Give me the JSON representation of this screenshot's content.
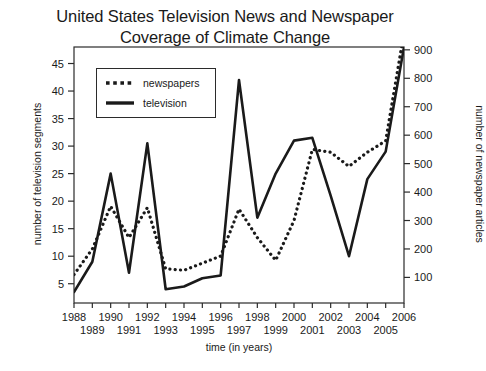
{
  "chart_data": {
    "type": "line",
    "title": "United States Television News and Newspaper Coverage of Climate Change",
    "title_line1": "United States Television News and Newspaper",
    "title_line2": "Coverage of Climate Change",
    "xlabel": "time (in years)",
    "ylabel": "number of television segments",
    "ylabel_right": "number of newspaper articles",
    "x": [
      1988,
      1989,
      1990,
      1991,
      1992,
      1993,
      1994,
      1995,
      1996,
      1997,
      1998,
      1999,
      2000,
      2001,
      2002,
      2003,
      2004,
      2005,
      2006
    ],
    "categories": [
      "1988",
      "1989",
      "1990",
      "1991",
      "1992",
      "1993",
      "1994",
      "1995",
      "1996",
      "1997",
      "1998",
      "1999",
      "2000",
      "2001",
      "2002",
      "2003",
      "2004",
      "2005",
      "2006"
    ],
    "xlim": [
      1988,
      2006
    ],
    "ylim": [
      1.5,
      48
    ],
    "ylim_right": [
      10,
      910
    ],
    "yticks": [
      5,
      10,
      15,
      20,
      25,
      30,
      35,
      40,
      45
    ],
    "ytick_labels": [
      "5",
      "10",
      "15",
      "20",
      "25",
      "30",
      "35",
      "40",
      "45"
    ],
    "yticks_right": [
      100,
      200,
      300,
      400,
      500,
      600,
      700,
      800,
      900
    ],
    "ytick_labels_right": [
      "100",
      "200",
      "300",
      "400",
      "500",
      "600",
      "700",
      "800",
      "900"
    ],
    "xticks_top_row": [
      "1988",
      "1990",
      "1992",
      "1994",
      "1996",
      "1998",
      "2000",
      "2002",
      "2004",
      "2006"
    ],
    "xticks_bottom_row": [
      "1989",
      "1991",
      "1993",
      "1995",
      "1997",
      "1999",
      "2001",
      "2003",
      "2005"
    ],
    "grid": false,
    "legend_position": "upper left",
    "series": [
      {
        "name": "newspapers",
        "axis": "right",
        "style": "dotted",
        "color": "#1a1a1a",
        "values": [
          110,
          200,
          350,
          240,
          345,
          130,
          125,
          150,
          175,
          340,
          240,
          160,
          300,
          550,
          540,
          490,
          540,
          580,
          960
        ]
      },
      {
        "name": "television",
        "axis": "left",
        "style": "solid",
        "color": "#1a1a1a",
        "values": [
          3.5,
          9,
          25,
          7,
          30.5,
          4,
          4.5,
          6,
          6.5,
          42,
          17,
          25,
          31,
          31.5,
          21,
          10,
          24,
          29,
          48
        ]
      }
    ],
    "legend": [
      {
        "label": "newspapers",
        "style": "dotted"
      },
      {
        "label": "television",
        "style": "solid"
      }
    ],
    "colors": {
      "axis": "#2b2b2b",
      "text": "#1a1a1a",
      "background": "#ffffff",
      "series": "#1a1a1a"
    }
  }
}
